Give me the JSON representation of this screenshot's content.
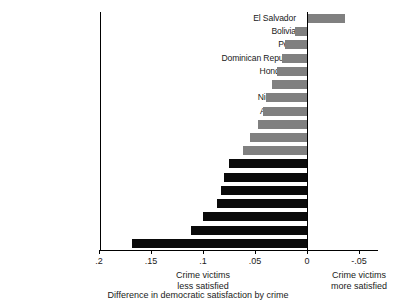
{
  "chart_data": {
    "type": "bar",
    "orientation": "horizontal",
    "title": "",
    "caption": "Difference in democratic satisfaction by crime",
    "xlabel": "",
    "ylabel": "",
    "xlim": [
      0.2,
      -0.065
    ],
    "axis_reversed": true,
    "grid": false,
    "legend": "none",
    "tick_labels": [
      ".2",
      ".15",
      ".1",
      ".05",
      "0",
      "-.05"
    ],
    "tick_values": [
      0.2,
      0.15,
      0.1,
      0.05,
      0,
      -0.05
    ],
    "annotations": [
      {
        "text_line1": "Crime victims",
        "text_line2": "less satisfied",
        "x": 0.1
      },
      {
        "text_line1": "Crime victims",
        "text_line2": "more satisfied",
        "x": -0.05
      }
    ],
    "colors": {
      "negative_bar": "#808080",
      "positive_bar": "#0a0a0a",
      "axis": "#000000",
      "background": "#ffffff"
    },
    "categories": [
      "El Salvador",
      "Bolivia",
      "Peru",
      "Dominican Republic",
      "Honduras",
      "Chile",
      "Nicaragua",
      "Argentina",
      "Uruguay",
      "Costa Rica",
      "Panama",
      "Mexico",
      "Venezuela",
      "Brazil",
      "Paraguay",
      "Colombia",
      "Guatemala",
      "Ecuador"
    ],
    "values": [
      -0.037,
      0.012,
      0.021,
      0.024,
      0.029,
      0.034,
      0.039,
      0.042,
      0.047,
      0.055,
      0.062,
      0.075,
      0.08,
      0.083,
      0.087,
      0.1,
      0.112,
      0.168
    ],
    "bars": [
      {
        "label": "El Salvador",
        "value": -0.037,
        "color_key": "negative_bar"
      },
      {
        "label": "Bolivia",
        "value": 0.012,
        "color_key": "negative_bar"
      },
      {
        "label": "Peru",
        "value": 0.021,
        "color_key": "negative_bar"
      },
      {
        "label": "Dominican Republic",
        "value": 0.024,
        "color_key": "negative_bar"
      },
      {
        "label": "Honduras",
        "value": 0.029,
        "color_key": "negative_bar"
      },
      {
        "label": "Chile",
        "value": 0.034,
        "color_key": "negative_bar"
      },
      {
        "label": "Nicaragua",
        "value": 0.039,
        "color_key": "negative_bar"
      },
      {
        "label": "Argentina",
        "value": 0.042,
        "color_key": "negative_bar"
      },
      {
        "label": "Uruguay",
        "value": 0.047,
        "color_key": "negative_bar"
      },
      {
        "label": "Costa Rica",
        "value": 0.055,
        "color_key": "negative_bar"
      },
      {
        "label": "Panama",
        "value": 0.062,
        "color_key": "negative_bar"
      },
      {
        "label": "Mexico",
        "value": 0.075,
        "color_key": "positive_bar"
      },
      {
        "label": "Venezuela",
        "value": 0.08,
        "color_key": "positive_bar"
      },
      {
        "label": "Brazil",
        "value": 0.083,
        "color_key": "positive_bar"
      },
      {
        "label": "Paraguay",
        "value": 0.087,
        "color_key": "positive_bar"
      },
      {
        "label": "Colombia",
        "value": 0.1,
        "color_key": "positive_bar"
      },
      {
        "label": "Guatemala",
        "value": 0.112,
        "color_key": "positive_bar"
      },
      {
        "label": "Ecuador",
        "value": 0.168,
        "color_key": "positive_bar"
      }
    ]
  }
}
